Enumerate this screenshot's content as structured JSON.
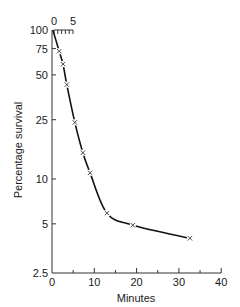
{
  "chart_data": {
    "type": "line",
    "title": "",
    "xlabel": "Minutes",
    "ylabel": "Percentage survival",
    "xlim": [
      0,
      40
    ],
    "ylim": [
      2.5,
      100
    ],
    "yscale": "log",
    "grid": false,
    "legend": null,
    "x_ticks": [
      0,
      10,
      20,
      30,
      40
    ],
    "x_tick_labels": [
      "0",
      "10",
      "20",
      "30",
      "40"
    ],
    "y_ticks": [
      100,
      75,
      50,
      25,
      10,
      5,
      2.5
    ],
    "y_tick_labels": [
      "100",
      "75",
      "50",
      "25",
      "10",
      "5",
      "2.5"
    ],
    "inset_axis": {
      "position": "top",
      "range": [
        0,
        5
      ],
      "tick_labels": [
        "0",
        "5"
      ]
    },
    "series": [
      {
        "name": "Percentage survival",
        "marker": "x",
        "x": [
          1.7,
          2.6,
          3.5,
          5.4,
          7.3,
          9.0,
          13.0,
          19.1,
          32.6
        ],
        "values": [
          72,
          59,
          43,
          24,
          15,
          11,
          5.9,
          4.9,
          4.0
        ]
      }
    ]
  }
}
